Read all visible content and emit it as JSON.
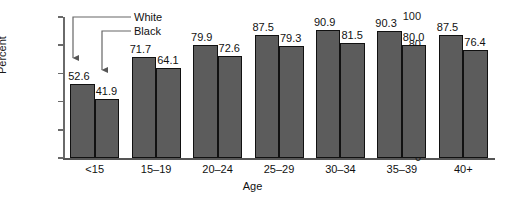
{
  "chart_data": {
    "type": "bar",
    "title": "",
    "xlabel": "Age",
    "ylabel": "Percent",
    "categories": [
      "<15",
      "15–19",
      "20–24",
      "25–29",
      "30–34",
      "35–39",
      "40+"
    ],
    "series": [
      {
        "name": "White",
        "values": [
          52.6,
          71.7,
          79.9,
          87.5,
          90.9,
          90.3,
          87.5
        ]
      },
      {
        "name": "Black",
        "values": [
          41.9,
          64.1,
          72.6,
          79.3,
          81.5,
          80.0,
          76.4
        ]
      }
    ],
    "value_labels": {
      "White": [
        "52.6",
        "71.7",
        "79.9",
        "87.5",
        "90.9",
        "90.3",
        "87.5"
      ],
      "Black": [
        "41.9",
        "64.1",
        "72.6",
        "79.3",
        "81.5",
        "80.0",
        "76.4"
      ]
    },
    "ylim": [
      0,
      100
    ],
    "yticks": [
      0,
      20,
      40,
      60,
      80,
      100
    ],
    "ytick_labels": [
      "0",
      "20",
      "40",
      "60",
      "80",
      "100"
    ],
    "grid": false,
    "legend_position": "annotation-arrows",
    "bar_color": "#5c5c5c",
    "bar_edge_color": "#111111",
    "axis_color": "#6a6a6a",
    "annotations": [
      {
        "label": "White",
        "points_to": "first-group-white-bar"
      },
      {
        "label": "Black",
        "points_to": "first-group-black-bar"
      }
    ]
  },
  "axes": {
    "y_title": "Percent",
    "x_title": "Age"
  },
  "legend": {
    "white_label": "White",
    "black_label": "Black"
  }
}
